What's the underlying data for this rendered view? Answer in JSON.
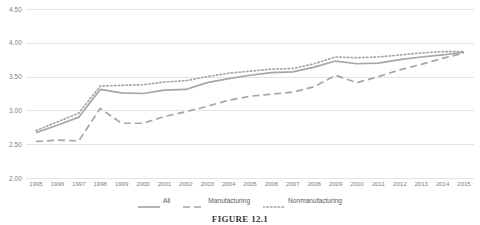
{
  "chart_data": {
    "type": "line",
    "title": "",
    "xlabel": "",
    "ylabel": "",
    "ylim": [
      2.0,
      4.5
    ],
    "ytick_values": [
      4.5,
      4.0,
      3.5,
      3.0,
      2.5,
      2.0
    ],
    "ytick_labels": [
      "4.50",
      "4.00",
      "3.50",
      "3.00",
      "2.50",
      "2.00"
    ],
    "grid": true,
    "legend_position": "bottom",
    "categories": [
      "1995",
      "1996",
      "1997",
      "1998",
      "1999",
      "2000",
      "2001",
      "2002",
      "2003",
      "2004",
      "2005",
      "2006",
      "2007",
      "2008",
      "2009",
      "2010",
      "2011",
      "2012",
      "2013",
      "2014",
      "2015"
    ],
    "series": [
      {
        "name": "All",
        "style": "solid",
        "color": "#a6a6a6",
        "values": [
          2.67,
          2.78,
          2.9,
          3.31,
          3.26,
          3.25,
          3.3,
          3.31,
          3.41,
          3.47,
          3.52,
          3.56,
          3.57,
          3.64,
          3.73,
          3.69,
          3.7,
          3.75,
          3.79,
          3.82,
          3.86
        ]
      },
      {
        "name": "Manufacturing",
        "style": "dashed",
        "color": "#a6a6a6",
        "values": [
          2.54,
          2.56,
          2.55,
          3.03,
          2.81,
          2.81,
          2.91,
          2.98,
          3.06,
          3.15,
          3.21,
          3.24,
          3.27,
          3.35,
          3.52,
          3.41,
          3.5,
          3.6,
          3.68,
          3.77,
          3.85
        ]
      },
      {
        "name": "Nonmanufacturing",
        "style": "dotted",
        "color": "#a6a6a6",
        "values": [
          2.7,
          2.83,
          2.96,
          3.36,
          3.37,
          3.38,
          3.42,
          3.44,
          3.5,
          3.55,
          3.58,
          3.61,
          3.62,
          3.69,
          3.79,
          3.78,
          3.79,
          3.82,
          3.85,
          3.87,
          3.87
        ]
      }
    ]
  },
  "legend": {
    "items": [
      {
        "label": "All",
        "style": "solid"
      },
      {
        "label": "Manufacturing",
        "style": "dashed"
      },
      {
        "label": "Nonmanufacturing",
        "style": "dotted"
      }
    ]
  },
  "caption": {
    "figure_number": "FIGURE 12.1"
  }
}
